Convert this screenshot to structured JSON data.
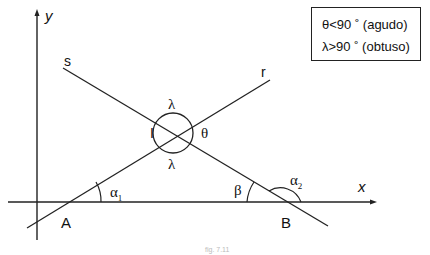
{
  "diagram": {
    "axes": {
      "x_label": "x",
      "y_label": "y"
    },
    "lines": [
      {
        "name": "r",
        "label": "r"
      },
      {
        "name": "s",
        "label": "s"
      }
    ],
    "points": {
      "A": "A",
      "B": "B",
      "I": "I"
    },
    "angles": {
      "alpha1": {
        "symbol": "α",
        "subscript": "1"
      },
      "alpha2": {
        "symbol": "α",
        "subscript": "2"
      },
      "beta": "β",
      "theta": "θ",
      "lambda_top": "λ",
      "lambda_bottom": "λ"
    },
    "legend": {
      "row1": "θ<90 ˚ (agudo)",
      "row2": "λ>90 ˚ (obtuso)"
    },
    "caption": "fig. 7.11",
    "colors": {
      "stroke": "#222222",
      "background": "#ffffff"
    }
  }
}
